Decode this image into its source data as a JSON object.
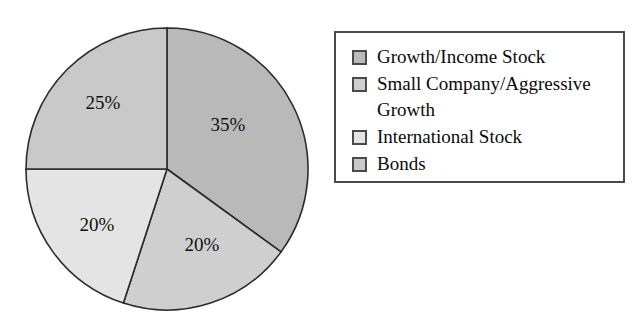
{
  "chart_data": {
    "type": "pie",
    "title": "",
    "subtitle": "",
    "xlabel": "",
    "ylabel": "",
    "legend_position": "right",
    "grid": false,
    "start_angle_deg": 0,
    "direction": "clockwise",
    "categories": [
      "Growth/Income Stock",
      "Small Company/Aggressive Growth",
      "International Stock",
      "Bonds"
    ],
    "values": [
      35,
      20,
      20,
      25
    ],
    "data_labels": [
      "35%",
      "20%",
      "20%",
      "25%"
    ],
    "colors": [
      "#b9b9b9",
      "#cfcfcf",
      "#e4e4e4",
      "#c9c9c9"
    ],
    "slices": [
      {
        "label": "Growth/Income Stock",
        "value": 35,
        "data_label": "35%",
        "color": "#b9b9b9",
        "start_deg": 0,
        "end_deg": 126,
        "label_x": 228,
        "label_y": 127
      },
      {
        "label": "Small Company/Aggressive Growth",
        "value": 20,
        "data_label": "20%",
        "color": "#cfcfcf",
        "start_deg": 126,
        "end_deg": 198,
        "label_x": 202,
        "label_y": 247
      },
      {
        "label": "International Stock",
        "value": 20,
        "data_label": "20%",
        "color": "#e4e4e4",
        "start_deg": 198,
        "end_deg": 270,
        "label_x": 97,
        "label_y": 227
      },
      {
        "label": "Bonds",
        "value": 25,
        "data_label": "25%",
        "color": "#c9c9c9",
        "start_deg": 270,
        "end_deg": 360,
        "label_x": 103,
        "label_y": 105
      }
    ]
  },
  "pie": {
    "center_x": 167,
    "center_y": 169,
    "radius": 141,
    "outline_color": "#2b2b2b",
    "labels": {
      "growth_income": "35%",
      "small_company": "20%",
      "international": "20%",
      "bonds": "25%"
    }
  },
  "legend": {
    "border_color": "#4a4a4a",
    "items": [
      {
        "label": "Growth/Income Stock",
        "color": "#b9b9b9"
      },
      {
        "label": "Small Company/Aggressive Growth",
        "color": "#cfcfcf"
      },
      {
        "label": "International Stock",
        "color": "#e4e4e4"
      },
      {
        "label": "Bonds",
        "color": "#c9c9c9"
      }
    ]
  }
}
